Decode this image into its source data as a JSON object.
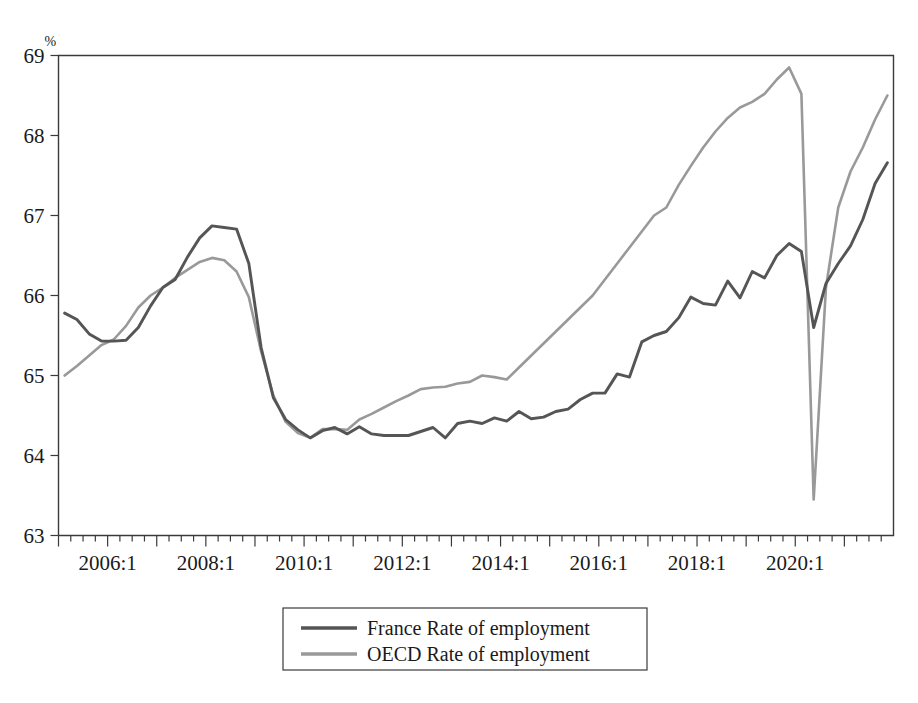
{
  "chart_data": {
    "type": "line",
    "title": "",
    "subtitle": "",
    "xlabel": "",
    "ylabel": "%",
    "ylim": [
      63,
      69
    ],
    "yticks": [
      63,
      64,
      65,
      66,
      67,
      68,
      69
    ],
    "ytick_labels": [
      "63",
      "64",
      "65",
      "66",
      "67",
      "68",
      "69"
    ],
    "y_unit_marker": "%",
    "grid": false,
    "legend_position": "bottom-center",
    "x_axis_type": "quarterly",
    "x_start": "2005:1",
    "x_end": "2021:4",
    "xtick_labels": [
      "2006:1",
      "2008:1",
      "2010:1",
      "2012:1",
      "2014:1",
      "2016:1",
      "2018:1",
      "2020:1"
    ],
    "xtick_periods": [
      "2006:1",
      "2008:1",
      "2010:1",
      "2012:1",
      "2014:1",
      "2016:1",
      "2018:1",
      "2020:1"
    ],
    "minor_tick_interval": "quarter",
    "major_tick_interval": "year",
    "x": [
      "2005:1",
      "2005:2",
      "2005:3",
      "2005:4",
      "2006:1",
      "2006:2",
      "2006:3",
      "2006:4",
      "2007:1",
      "2007:2",
      "2007:3",
      "2007:4",
      "2008:1",
      "2008:2",
      "2008:3",
      "2008:4",
      "2009:1",
      "2009:2",
      "2009:3",
      "2009:4",
      "2010:1",
      "2010:2",
      "2010:3",
      "2010:4",
      "2011:1",
      "2011:2",
      "2011:3",
      "2011:4",
      "2012:1",
      "2012:2",
      "2012:3",
      "2012:4",
      "2013:1",
      "2013:2",
      "2013:3",
      "2013:4",
      "2014:1",
      "2014:2",
      "2014:3",
      "2014:4",
      "2015:1",
      "2015:2",
      "2015:3",
      "2015:4",
      "2016:1",
      "2016:2",
      "2016:3",
      "2016:4",
      "2017:1",
      "2017:2",
      "2017:3",
      "2017:4",
      "2018:1",
      "2018:2",
      "2018:3",
      "2018:4",
      "2019:1",
      "2019:2",
      "2019:3",
      "2019:4",
      "2020:1",
      "2020:2",
      "2020:3",
      "2020:4",
      "2021:1",
      "2021:2",
      "2021:3",
      "2021:4"
    ],
    "series": [
      {
        "name": "France Rate of employment",
        "color": "#555555",
        "values": [
          65.78,
          65.7,
          65.52,
          65.43,
          65.43,
          65.44,
          65.6,
          65.87,
          66.1,
          66.2,
          66.48,
          66.72,
          66.87,
          66.85,
          66.83,
          66.4,
          65.35,
          64.72,
          64.45,
          64.32,
          64.22,
          64.31,
          64.35,
          64.27,
          64.36,
          64.27,
          64.25,
          64.25,
          64.25,
          64.3,
          64.35,
          64.22,
          64.4,
          64.43,
          64.4,
          64.47,
          64.43,
          64.55,
          64.46,
          64.48,
          64.55,
          64.58,
          64.7,
          64.78,
          64.78,
          65.02,
          64.98,
          65.42,
          65.5,
          65.55,
          65.72,
          65.98,
          65.9,
          65.88,
          66.18,
          65.97,
          66.3,
          66.22,
          66.5,
          66.65,
          66.55,
          65.6,
          66.15,
          66.4,
          66.62,
          66.95,
          67.4,
          67.66
        ]
      },
      {
        "name": "OECD Rate of employment",
        "color": "#999999",
        "values": [
          65.0,
          65.12,
          65.25,
          65.38,
          65.45,
          65.62,
          65.85,
          66.0,
          66.1,
          66.22,
          66.32,
          66.42,
          66.47,
          66.44,
          66.3,
          65.98,
          65.3,
          64.75,
          64.42,
          64.28,
          64.22,
          64.33,
          64.33,
          64.32,
          64.45,
          64.52,
          64.6,
          64.68,
          64.75,
          64.83,
          64.85,
          64.86,
          64.9,
          64.92,
          65.0,
          64.98,
          64.95,
          65.1,
          65.25,
          65.4,
          65.55,
          65.7,
          65.85,
          66.0,
          66.2,
          66.4,
          66.6,
          66.8,
          67.0,
          67.1,
          67.38,
          67.62,
          67.85,
          68.05,
          68.22,
          68.35,
          68.42,
          68.52,
          68.7,
          68.85,
          68.52,
          63.45,
          66.1,
          67.1,
          67.55,
          67.85,
          68.2,
          68.5
        ]
      }
    ]
  },
  "legend": {
    "entries": [
      {
        "label": "France Rate of employment",
        "color": "#555555"
      },
      {
        "label": "OECD Rate of employment",
        "color": "#999999"
      }
    ]
  }
}
